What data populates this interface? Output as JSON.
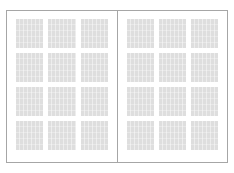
{
  "document": {
    "type": "two-page-spread",
    "background_color": "#ffffff",
    "border_color": "#a6a6a6",
    "page_color": "#ffffff",
    "placeholder_color": "#dedede",
    "total_placeholders": 24
  },
  "pages": [
    {
      "name": "left-page",
      "side": "left",
      "grid": {
        "columns": 3,
        "rows": 4,
        "count": 12
      },
      "placeholders": [
        {
          "row": 1,
          "column": 1
        },
        {
          "row": 1,
          "column": 2
        },
        {
          "row": 1,
          "column": 3
        },
        {
          "row": 2,
          "column": 1
        },
        {
          "row": 2,
          "column": 2
        },
        {
          "row": 2,
          "column": 3
        },
        {
          "row": 3,
          "column": 1
        },
        {
          "row": 3,
          "column": 2
        },
        {
          "row": 3,
          "column": 3
        },
        {
          "row": 4,
          "column": 1
        },
        {
          "row": 4,
          "column": 2
        },
        {
          "row": 4,
          "column": 3
        }
      ]
    },
    {
      "name": "right-page",
      "side": "right",
      "grid": {
        "columns": 3,
        "rows": 4,
        "count": 12
      },
      "placeholders": [
        {
          "row": 1,
          "column": 1
        },
        {
          "row": 1,
          "column": 2
        },
        {
          "row": 1,
          "column": 3
        },
        {
          "row": 2,
          "column": 1
        },
        {
          "row": 2,
          "column": 2
        },
        {
          "row": 2,
          "column": 3
        },
        {
          "row": 3,
          "column": 1
        },
        {
          "row": 3,
          "column": 2
        },
        {
          "row": 3,
          "column": 3
        },
        {
          "row": 4,
          "column": 1
        },
        {
          "row": 4,
          "column": 2
        },
        {
          "row": 4,
          "column": 3
        }
      ]
    }
  ]
}
